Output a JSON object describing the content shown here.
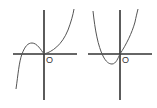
{
  "graphs": [
    {
      "id": "cubic",
      "description": "Cubic curve: rises from lower-left, local max left of origin, passes through origin (local min), rises to upper-right",
      "origin_label": "O"
    },
    {
      "id": "parabola",
      "description": "Upward-opening parabola with vertex below x-axis, left of origin, passing through origin",
      "origin_label": "O"
    }
  ]
}
